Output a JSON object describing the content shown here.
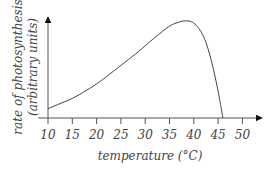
{
  "chart_data": {
    "type": "line",
    "title": "",
    "xlabel": "temperature (°C)",
    "ylabel_line1": "rate of photosynthesis",
    "ylabel_line2": "(arbitrary units)",
    "x_ticks": [
      10,
      15,
      20,
      25,
      30,
      35,
      40,
      45,
      50
    ],
    "xlim": [
      10,
      54
    ],
    "ylim": [
      0,
      100
    ],
    "grid": false,
    "legend": null,
    "y_ticks": [],
    "series": [
      {
        "name": "rate of photosynthesis",
        "x": [
          10,
          12,
          15,
          18,
          20,
          22,
          25,
          28,
          30,
          32,
          35,
          37,
          38,
          39,
          40,
          41,
          42,
          43,
          44,
          45,
          45.5,
          46
        ],
        "y": [
          9,
          13,
          19,
          27,
          33,
          40,
          51,
          62,
          70,
          78,
          89,
          93,
          94,
          94,
          92,
          87,
          79,
          66,
          48,
          26,
          13,
          0
        ]
      }
    ]
  }
}
